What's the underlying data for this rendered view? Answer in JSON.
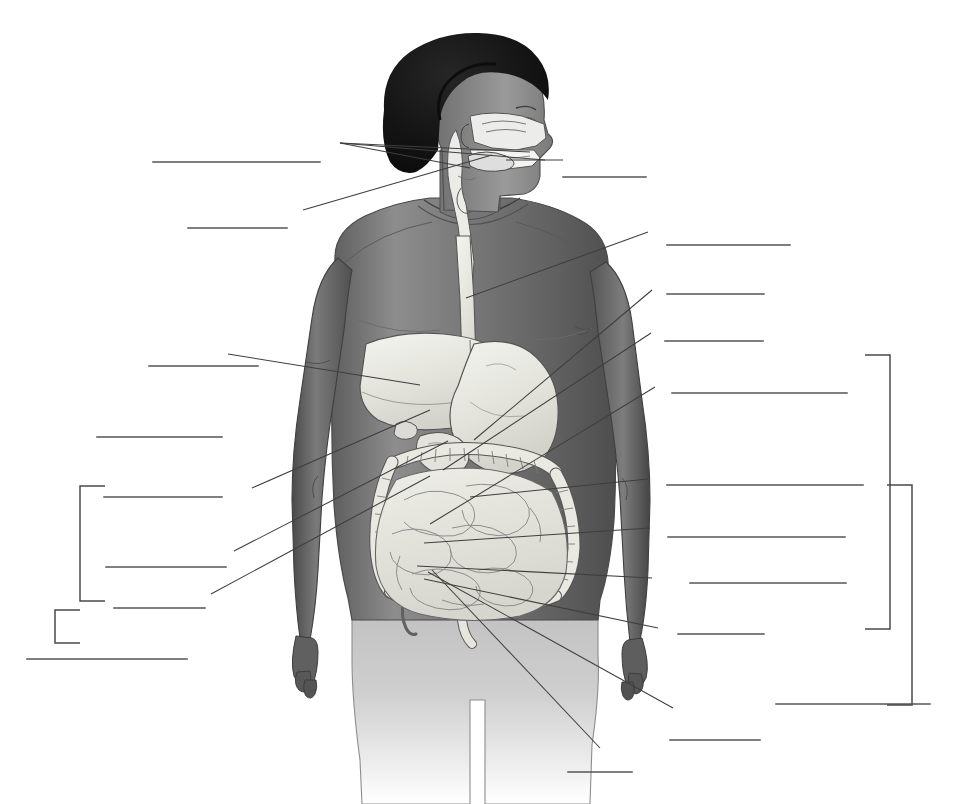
{
  "page": {
    "kind": "anatomy-diagram-blank-labeling-exercise",
    "header_artifact_text": "",
    "background_color": "#ffffff",
    "ink_color": "#3a3a3a",
    "width": 958,
    "height": 804
  },
  "figure": {
    "name": "human-digestive-system",
    "skin_color": "#6f6f6f",
    "organ_color": "#e9e9e4",
    "hair_color": "#171717",
    "regions": [
      {
        "name": "head-sagittal-section",
        "detail": "nasal cavity, hard palate, oral cavity, tongue, pharynx, epiglottis"
      },
      {
        "name": "neck",
        "detail": "esophagus and trachea descending"
      },
      {
        "name": "thorax",
        "detail": "esophagus passing behind sternum"
      },
      {
        "name": "abdomen",
        "detail": "liver, gallbladder, stomach, duodenum, pancreas region, transverse colon, ascending colon, descending colon, small intestine, cecum, appendix, sigmoid colon, rectum"
      }
    ]
  },
  "answer_lines": {
    "count": 22,
    "description": "blank ruled lines where the student writes each structure name",
    "left": [
      {
        "id": "L1",
        "x1": 153,
        "x2": 320,
        "y": 162
      },
      {
        "id": "L2",
        "x1": 188,
        "x2": 287,
        "y": 228
      },
      {
        "id": "L3",
        "x1": 149,
        "x2": 258,
        "y": 366
      },
      {
        "id": "L4",
        "x1": 97,
        "x2": 222,
        "y": 437
      },
      {
        "id": "L5",
        "x1": 104,
        "x2": 222,
        "y": 497
      },
      {
        "id": "L6",
        "x1": 106,
        "x2": 226,
        "y": 567
      },
      {
        "id": "L7",
        "x1": 114,
        "x2": 205,
        "y": 608
      },
      {
        "id": "L8",
        "x1": 27,
        "x2": 187,
        "y": 659
      }
    ],
    "right": [
      {
        "id": "R1",
        "x1": 563,
        "x2": 646,
        "y": 177
      },
      {
        "id": "R2",
        "x1": 667,
        "x2": 790,
        "y": 245
      },
      {
        "id": "R3",
        "x1": 667,
        "x2": 764,
        "y": 294
      },
      {
        "id": "R4",
        "x1": 665,
        "x2": 763,
        "y": 341
      },
      {
        "id": "R5",
        "x1": 672,
        "x2": 847,
        "y": 393
      },
      {
        "id": "R6",
        "x1": 667,
        "x2": 863,
        "y": 485
      },
      {
        "id": "R7",
        "x1": 668,
        "x2": 845,
        "y": 537
      },
      {
        "id": "R8",
        "x1": 690,
        "x2": 846,
        "y": 583
      },
      {
        "id": "R9",
        "x1": 678,
        "x2": 764,
        "y": 634
      },
      {
        "id": "R10",
        "x1": 776,
        "x2": 930,
        "y": 704
      },
      {
        "id": "R11",
        "x1": 670,
        "x2": 760,
        "y": 740
      },
      {
        "id": "R12",
        "x1": 568,
        "x2": 632,
        "y": 772
      }
    ]
  },
  "leader_lines": {
    "description": "thin pointer lines running from each blank answer line to the structure it identifies",
    "left_fan_origin": {
      "x": 340,
      "y": 143
    },
    "segments": [
      {
        "from": [
          340,
          143
        ],
        "to": [
          530,
          152
        ],
        "target": "nasal-cavity"
      },
      {
        "from": [
          340,
          143
        ],
        "to": [
          545,
          160
        ],
        "target": "hard-palate"
      },
      {
        "from": [
          340,
          143
        ],
        "to": [
          470,
          168
        ],
        "target": "oral-cavity"
      },
      {
        "from": [
          303,
          210
        ],
        "to": [
          492,
          155
        ],
        "target": "tongue"
      },
      {
        "from": [
          506,
          160
        ],
        "to": [
          563,
          160
        ],
        "target": "mouth-opening"
      },
      {
        "from": [
          228,
          354
        ],
        "to": [
          420,
          385
        ],
        "target": "liver"
      },
      {
        "from": [
          252,
          488
        ],
        "to": [
          430,
          410
        ],
        "target": "gallbladder"
      },
      {
        "from": [
          234,
          551
        ],
        "to": [
          448,
          441
        ],
        "target": "duodenum"
      },
      {
        "from": [
          211,
          594
        ],
        "to": [
          430,
          476
        ],
        "target": "transverse-colon"
      },
      {
        "from": [
          648,
          232
        ],
        "to": [
          466,
          298
        ],
        "target": "esophagus"
      },
      {
        "from": [
          652,
          290
        ],
        "to": [
          474,
          440
        ],
        "target": "stomach"
      },
      {
        "from": [
          651,
          333
        ],
        "to": [
          443,
          470
        ],
        "target": "pancreas"
      },
      {
        "from": [
          655,
          387
        ],
        "to": [
          430,
          524
        ],
        "target": "ascending-colon"
      },
      {
        "from": [
          648,
          479
        ],
        "to": [
          470,
          497
        ],
        "target": "descending-colon"
      },
      {
        "from": [
          650,
          528
        ],
        "to": [
          424,
          543
        ],
        "target": "small-intestine"
      },
      {
        "from": [
          652,
          578
        ],
        "to": [
          417,
          566
        ],
        "target": "cecum"
      },
      {
        "from": [
          658,
          628
        ],
        "to": [
          424,
          579
        ],
        "target": "appendix"
      },
      {
        "from": [
          673,
          708
        ],
        "to": [
          428,
          572
        ],
        "target": "sigmoid-colon"
      },
      {
        "from": [
          600,
          748
        ],
        "to": [
          432,
          570
        ],
        "target": "rectum-anus"
      }
    ]
  },
  "brackets": {
    "description": "square brackets grouping several blank lines into larger regional categories",
    "left": [
      {
        "id": "left-inner-bracket",
        "x_spine": 80,
        "y_top": 486,
        "y_bottom": 601,
        "tick_len": 25,
        "group_of": [
          "L5",
          "L6",
          "L7"
        ]
      },
      {
        "id": "left-outer-bracket",
        "x_spine": 55,
        "y_top": 610,
        "y_bottom": 643,
        "tick_len": 25,
        "group_of": [
          "left-inner-bracket",
          "L8"
        ]
      }
    ],
    "right": [
      {
        "id": "right-inner-bracket",
        "x_spine": 890,
        "y_top": 355,
        "y_bottom": 629,
        "tick_len": 25,
        "group_of": [
          "R5",
          "R6",
          "R7",
          "R8",
          "R9"
        ]
      },
      {
        "id": "right-outer-bracket",
        "x_spine": 912,
        "y_top": 485,
        "y_bottom": 705,
        "tick_len": 25,
        "group_of": [
          "right-inner-bracket",
          "R10"
        ]
      }
    ]
  }
}
